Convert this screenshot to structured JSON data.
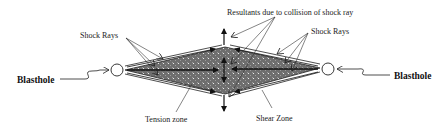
{
  "diagram": {
    "labels": {
      "blasthole_left": "Blasthole",
      "blasthole_right": "Blasthole",
      "shock_rays_left": "Shock Rays",
      "shock_rays_right": "Shock Rays",
      "resultants": "Resultants due to collision of shock ray",
      "tension_zone": "Tension zone",
      "shear_zone": "Shear Zone"
    },
    "colors": {
      "zone_fill": "#7a7a7a",
      "line": "#222222",
      "background": "#ffffff"
    }
  }
}
